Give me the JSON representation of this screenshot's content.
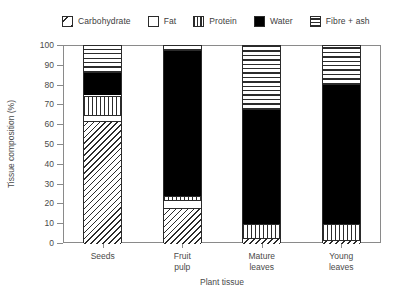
{
  "chart_data": {
    "type": "bar",
    "subtype": "stacked-bar",
    "title": "",
    "xlabel": "Plant tissue",
    "ylabel": "Tissue composition (%)",
    "ylim": [
      0,
      100
    ],
    "yticks": [
      0,
      10,
      20,
      30,
      40,
      50,
      60,
      70,
      80,
      90,
      100
    ],
    "grid": false,
    "legend_position": "top",
    "categories": [
      "Seeds",
      "Fruit pulp",
      "Mature leaves",
      "Young leaves"
    ],
    "category_labels_multiline": [
      "Seeds",
      "Fruit\npulp",
      "Mature\nleaves",
      "Young\nleaves"
    ],
    "stack_order_bottom_to_top": [
      "Carbohydrate",
      "Fat",
      "Protein",
      "Water",
      "Fibre + ash"
    ],
    "series": [
      {
        "name": "Carbohydrate",
        "pattern": "diagonal-hatch",
        "values": [
          62,
          18,
          3,
          2
        ]
      },
      {
        "name": "Fat",
        "pattern": "white-empty",
        "values": [
          3,
          4,
          0,
          0
        ]
      },
      {
        "name": "Protein",
        "pattern": "vertical-lines",
        "values": [
          10,
          2,
          7,
          8
        ]
      },
      {
        "name": "Water",
        "pattern": "solid-black",
        "values": [
          12,
          74,
          58,
          71
        ]
      },
      {
        "name": "Fibre + ash",
        "pattern": "horizontal-lines",
        "values": [
          13,
          2,
          32,
          19
        ]
      }
    ],
    "cumulative_boundaries": {
      "Seeds": [
        0,
        62,
        65,
        75,
        87,
        100
      ],
      "Fruit pulp": [
        0,
        18,
        22,
        24,
        98,
        100
      ],
      "Mature leaves": [
        0,
        3,
        3,
        10,
        68,
        100
      ],
      "Young leaves": [
        0,
        2,
        2,
        10,
        81,
        100
      ]
    }
  },
  "legend": {
    "items": [
      {
        "label": "Carbohydrate",
        "swatch": "carbohydrate-swatch"
      },
      {
        "label": "Fat",
        "swatch": "fat-swatch"
      },
      {
        "label": "Protein",
        "swatch": "protein-swatch"
      },
      {
        "label": "Water",
        "swatch": "water-swatch"
      },
      {
        "label": "Fibre + ash",
        "swatch": "fibre-ash-swatch"
      }
    ]
  },
  "axes": {
    "y_title": "Tissue composition (%)",
    "x_title": "Plant tissue",
    "y_tick_labels": [
      "0",
      "10",
      "20",
      "30",
      "40",
      "50",
      "60",
      "70",
      "80",
      "90",
      "100"
    ],
    "x_tick_labels": [
      "Seeds",
      "Fruit\npulp",
      "Mature\nleaves",
      "Young\nleaves"
    ]
  },
  "colors": {
    "ink": "#2b2b2b",
    "axis": "#8a8a8a",
    "text": "#4a4a4a",
    "water": "#000000",
    "background": "#ffffff"
  }
}
